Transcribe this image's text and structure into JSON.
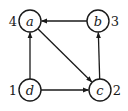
{
  "diagram": {
    "type": "directed-graph",
    "nodes": [
      {
        "id": "a",
        "label": "a",
        "order": "4",
        "x": 30,
        "y": 21,
        "order_side": "left"
      },
      {
        "id": "b",
        "label": "b",
        "order": "3",
        "x": 98,
        "y": 21,
        "order_side": "right"
      },
      {
        "id": "c",
        "label": "c",
        "order": "2",
        "x": 100,
        "y": 90,
        "order_side": "right"
      },
      {
        "id": "d",
        "label": "d",
        "order": "1",
        "x": 30,
        "y": 90,
        "order_side": "left"
      }
    ],
    "edges": [
      {
        "from": "d",
        "to": "a"
      },
      {
        "from": "d",
        "to": "c"
      },
      {
        "from": "a",
        "to": "c"
      },
      {
        "from": "c",
        "to": "b"
      },
      {
        "from": "b",
        "to": "a"
      }
    ],
    "node_radius": 11,
    "colors": {
      "stroke": "#1a1a1a",
      "background": "#ffffff"
    }
  }
}
